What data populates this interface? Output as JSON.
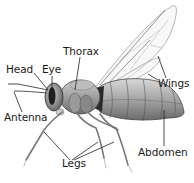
{
  "diagram": {
    "labels": {
      "head": "Head",
      "eye": "Eye",
      "thorax": "Thorax",
      "wings": "Wings",
      "antenna": "Antenna",
      "legs": "Legs",
      "abdomen": "Abdomen"
    },
    "colors": {
      "background": "#ffffff",
      "text": "#1a1a1a",
      "leader_lines": "#222222",
      "body_dark": "#3a3a3a",
      "body_mid": "#8a8a8a",
      "body_light": "#c8c8c8",
      "wing_outline": "#9a9a9a"
    }
  }
}
